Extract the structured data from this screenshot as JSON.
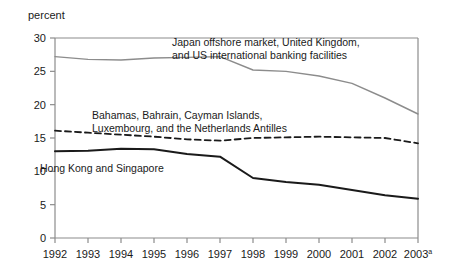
{
  "chart_data": {
    "type": "line",
    "title": "",
    "xlabel": "",
    "ylabel": "percent",
    "ylim": [
      0,
      30
    ],
    "yticks": [
      0,
      5,
      10,
      15,
      20,
      25,
      30
    ],
    "ytick_labels": [
      "0",
      "5",
      "10",
      "15",
      "20",
      "25",
      "30"
    ],
    "grid": false,
    "legend_position": "inline-annotations",
    "x": [
      1992,
      1993,
      1994,
      1995,
      1996,
      1997,
      1998,
      1999,
      2000,
      2001,
      2002,
      2003
    ],
    "xtick_labels": [
      "1992",
      "1993",
      "1994",
      "1995",
      "1996",
      "1997",
      "1998",
      "1999",
      "2000",
      "2001",
      "2002",
      "2003"
    ],
    "xtick_last_superscript": "a",
    "series": [
      {
        "name": "Japan offshore market, United Kingdom, and US international banking facilities",
        "label_line1": "Japan offshore market, United Kingdom,",
        "label_line2": "and US international banking facilities",
        "style": "solid",
        "color": "#8c8c8c",
        "width": 1.4,
        "values": [
          27.2,
          26.8,
          26.7,
          27.0,
          27.1,
          27.2,
          25.2,
          25.0,
          24.3,
          23.2,
          21.0,
          18.6
        ]
      },
      {
        "name": "Bahamas, Bahrain, Cayman Islands, Luxembourg, and the Netherlands Antilles",
        "label_line1": "Bahamas, Bahrain, Cayman Islands,",
        "label_line2": "Luxembourg, and the Netherlands Antilles",
        "style": "dashed",
        "color": "#1a1a1a",
        "width": 1.8,
        "values": [
          16.1,
          15.8,
          15.5,
          15.2,
          14.8,
          14.6,
          15.0,
          15.1,
          15.2,
          15.1,
          15.0,
          14.2
        ]
      },
      {
        "name": "Hong Kong and Singapore",
        "label_line1": "Hong Kong and Singapore",
        "label_line2": "",
        "style": "solid",
        "color": "#1a1a1a",
        "width": 2.0,
        "values": [
          13.0,
          13.1,
          13.4,
          13.3,
          12.6,
          12.2,
          9.0,
          8.4,
          8.0,
          7.2,
          6.4,
          5.9
        ]
      }
    ],
    "annotations": [
      {
        "id": "japan",
        "text_line1": "Japan offshore market, United Kingdom,",
        "text_line2": "and US international banking facilities",
        "x": 172,
        "y": 46
      },
      {
        "id": "bahamas",
        "text_line1": "Bahamas, Bahrain, Cayman Islands,",
        "text_line2": "Luxembourg, and the Netherlands Antilles",
        "x": 92,
        "y": 119
      },
      {
        "id": "hongkong",
        "text_line1": "Hong Kong and Singapore",
        "text_line2": "",
        "x": 40,
        "y": 172
      }
    ],
    "axis_color": "#8c8c8c",
    "text_color": "#1a1a1a"
  }
}
